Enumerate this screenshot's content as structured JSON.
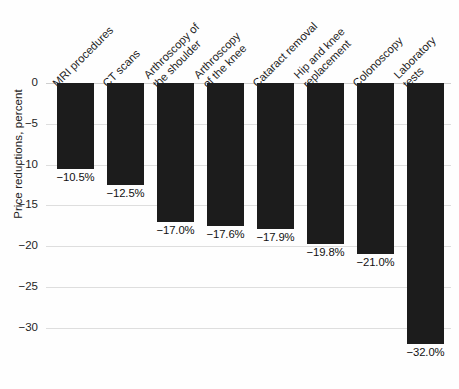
{
  "chart_data": {
    "type": "bar",
    "title": "",
    "subtitle": "",
    "xlabel": "",
    "ylabel": "Price reductions, percent",
    "ylim": [
      -34.5,
      0
    ],
    "grid": true,
    "legend": false,
    "orientation": "vertical",
    "bar_color": "#1c1c1c",
    "background_color": "#ffffff",
    "gridline_color": "#dedede",
    "categories": [
      "MRI procedures",
      "CT scans",
      "Arthroscopy of\nthe shoulder",
      "Arthroscopy\nof the knee",
      "Cataract removal",
      "Hip and knee\nreplacement",
      "Colonoscopy",
      "Laboratory\ntests"
    ],
    "values": [
      -10.5,
      -12.5,
      -17.0,
      -17.6,
      -17.9,
      -19.8,
      -21.0,
      -32.0
    ],
    "value_labels": [
      "−10.5%",
      "−12.5%",
      "−17.0%",
      "−17.6%",
      "−17.9%",
      "−19.8%",
      "−21.0%",
      "−32.0%"
    ],
    "y_ticks": [
      0,
      -5,
      -10,
      -15,
      -20,
      -25,
      -30
    ],
    "y_tick_labels": [
      "0",
      "−5",
      "−10",
      "−15",
      "−20",
      "−25",
      "−30"
    ]
  }
}
